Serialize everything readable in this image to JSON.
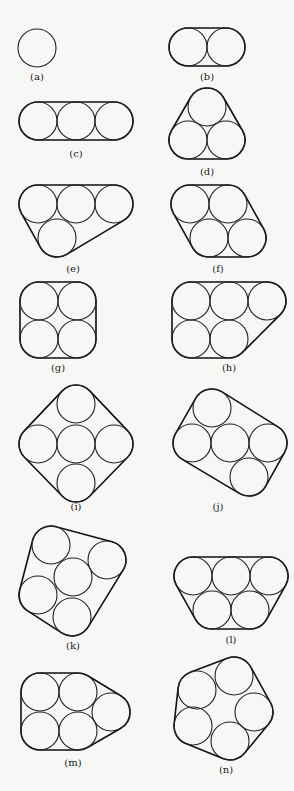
{
  "radius": 19,
  "panels": [
    {
      "id": "a",
      "label": "(a)",
      "label_pos": [
        37,
        80
      ],
      "circles": [
        [
          37,
          48
        ]
      ]
    },
    {
      "id": "b",
      "label": "(b)",
      "label_pos": [
        207,
        80
      ],
      "circles": [
        [
          188,
          47
        ],
        [
          226,
          47
        ]
      ]
    },
    {
      "id": "c",
      "label": "(c)",
      "label_pos": [
        76,
        157
      ],
      "circles": [
        [
          38,
          121
        ],
        [
          76,
          121
        ],
        [
          114,
          121
        ]
      ]
    },
    {
      "id": "d",
      "label": "(d)",
      "label_pos": [
        207,
        175
      ],
      "circles": [
        [
          207,
          107
        ],
        [
          188,
          140
        ],
        [
          226,
          140
        ]
      ]
    },
    {
      "id": "e",
      "label": "(e)",
      "label_pos": [
        73,
        272
      ],
      "circles": [
        [
          38,
          204
        ],
        [
          76,
          204
        ],
        [
          114,
          204
        ],
        [
          57,
          238
        ]
      ]
    },
    {
      "id": "f",
      "label": "(f)",
      "label_pos": [
        218,
        272
      ],
      "circles": [
        [
          190,
          204
        ],
        [
          228,
          204
        ],
        [
          209,
          238
        ],
        [
          247,
          238
        ]
      ]
    },
    {
      "id": "g",
      "label": "(g)",
      "label_pos": [
        58,
        371
      ],
      "circles": [
        [
          39,
          301
        ],
        [
          77,
          301
        ],
        [
          39,
          339
        ],
        [
          77,
          339
        ]
      ]
    },
    {
      "id": "h",
      "label": "(h)",
      "label_pos": [
        229,
        371
      ],
      "circles": [
        [
          191,
          301
        ],
        [
          229,
          301
        ],
        [
          267,
          301
        ],
        [
          191,
          339
        ],
        [
          229,
          339
        ]
      ]
    },
    {
      "id": "i",
      "label": "(i)",
      "label_pos": [
        76,
        510
      ],
      "circles": [
        [
          76,
          404
        ],
        [
          38,
          444
        ],
        [
          76,
          444
        ],
        [
          114,
          444
        ],
        [
          76,
          483
        ]
      ]
    },
    {
      "id": "j",
      "label": "(j)",
      "label_pos": [
        218,
        510
      ],
      "circles": [
        [
          212,
          408
        ],
        [
          192,
          443
        ],
        [
          230,
          443
        ],
        [
          268,
          443
        ],
        [
          249,
          477
        ]
      ]
    },
    {
      "id": "k",
      "label": "(k)",
      "label_pos": [
        73,
        649
      ],
      "circles": [
        [
          51,
          545
        ],
        [
          107,
          560
        ],
        [
          73,
          577
        ],
        [
          38,
          595
        ],
        [
          72,
          617
        ]
      ]
    },
    {
      "id": "l",
      "label": "(l)",
      "label_pos": [
        231,
        643
      ],
      "circles": [
        [
          193,
          576
        ],
        [
          231,
          576
        ],
        [
          269,
          576
        ],
        [
          212,
          610
        ],
        [
          250,
          610
        ]
      ]
    },
    {
      "id": "m",
      "label": "(m)",
      "label_pos": [
        73,
        766
      ],
      "circles": [
        [
          40,
          692
        ],
        [
          78,
          692
        ],
        [
          40,
          731
        ],
        [
          78,
          731
        ],
        [
          111,
          712
        ]
      ]
    },
    {
      "id": "n",
      "label": "(n)",
      "label_pos": [
        226,
        773
      ],
      "circles": [
        [
          197,
          690
        ],
        [
          234,
          676
        ],
        [
          254,
          712
        ],
        [
          230,
          741
        ],
        [
          193,
          726
        ]
      ]
    }
  ]
}
